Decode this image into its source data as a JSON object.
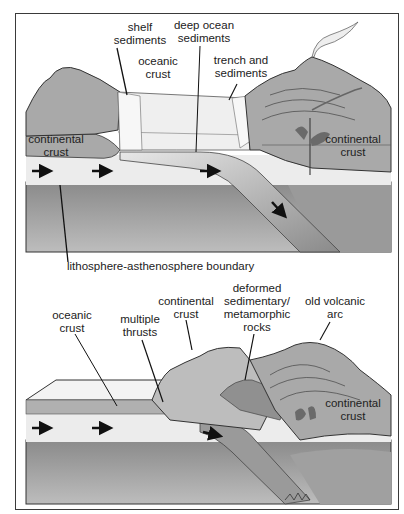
{
  "figure": {
    "title_partial": "Continental collision / subduction diagram",
    "top_panel": {
      "labels": {
        "shelf_sediments": [
          "shelf",
          "sediments"
        ],
        "deep_ocean_sediments": [
          "deep ocean",
          "sediments"
        ],
        "oceanic_crust": [
          "oceanic",
          "crust"
        ],
        "trench_and_sediments": [
          "trench and",
          "sediments"
        ],
        "continental_crust_left": [
          "continental",
          "crust"
        ],
        "continental_crust_right": [
          "continental",
          "crust"
        ],
        "lithosphere_asthenosphere_boundary": "lithosphere-asthenosphere boundary"
      },
      "arrows": [
        "plate-motion-right",
        "plate-motion-right",
        "plate-motion-right",
        "subduction-down-right"
      ]
    },
    "bottom_panel": {
      "labels": {
        "oceanic_crust": [
          "oceanic",
          "crust"
        ],
        "multiple_thrusts": [
          "multiple",
          "thrusts"
        ],
        "continental_crust_top": [
          "continental",
          "crust"
        ],
        "deformed_rocks": [
          "deformed",
          "sedimentary/",
          "metamorphic",
          "rocks"
        ],
        "old_volcanic_arc": [
          "old volcanic",
          "arc"
        ],
        "continental_crust_right": [
          "continental",
          "crust"
        ]
      },
      "arrows": [
        "plate-motion-right",
        "plate-motion-right",
        "subduction-down-right"
      ]
    },
    "colors": {
      "crust_gray": "#a9a9a9",
      "light_layer": "#ececec",
      "mantle_dark": "#8f8f8f",
      "outline": "#333333"
    }
  }
}
